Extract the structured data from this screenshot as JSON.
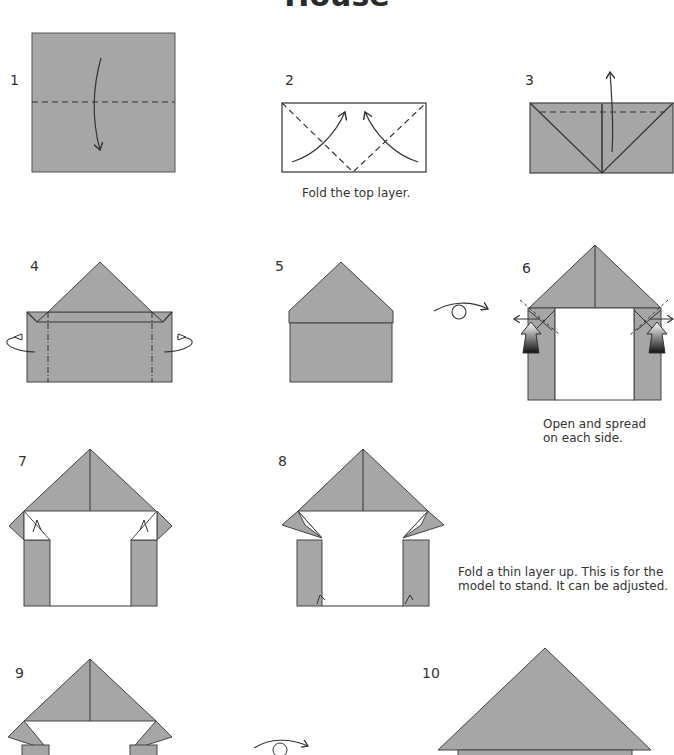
{
  "title": "House",
  "colors": {
    "paper": "#a6a6a6",
    "line": "#333333",
    "white": "#ffffff"
  },
  "steps": [
    {
      "number": "1"
    },
    {
      "number": "2",
      "caption": "Fold the top layer."
    },
    {
      "number": "3"
    },
    {
      "number": "4"
    },
    {
      "number": "5"
    },
    {
      "number": "6",
      "caption_line1": "Open and spread",
      "caption_line2": "on each side."
    },
    {
      "number": "7"
    },
    {
      "number": "8",
      "caption_line1": "Fold a thin layer up. This is for the",
      "caption_line2": "model to stand. It can be adjusted."
    },
    {
      "number": "9"
    },
    {
      "number": "10"
    }
  ]
}
